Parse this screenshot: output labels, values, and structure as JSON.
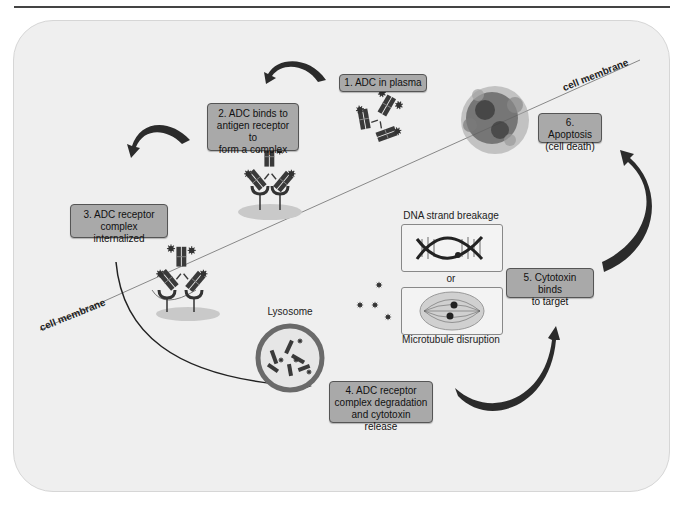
{
  "figure": {
    "steps": [
      {
        "number": 1,
        "label": "1. ADC in plasma"
      },
      {
        "number": 2,
        "label": "2. ADC binds to antigen receptor to form a complex"
      },
      {
        "number": 3,
        "label": "3. ADC receptor complex internalized"
      },
      {
        "number": 4,
        "label": "4. ADC receptor complex degradation and cytotoxin release"
      },
      {
        "number": 5,
        "label": "5. Cytotoxin binds to target"
      },
      {
        "number": 6,
        "label": "6. Apoptosis (cell death)"
      }
    ],
    "step_lines": {
      "s1": [
        "1. ADC in plasma"
      ],
      "s2": [
        "2. ADC binds to",
        "antigen receptor to",
        "form a complex"
      ],
      "s3": [
        "3. ADC receptor",
        "complex internalized"
      ],
      "s4": [
        "4. ADC receptor",
        "complex degradation",
        "and cytotoxin release"
      ],
      "s5": [
        "5. Cytotoxin binds",
        "to target"
      ],
      "s6": [
        "6. Apoptosis",
        "(cell death)"
      ]
    },
    "labels": {
      "membrane_left": "cell membrane",
      "membrane_right": "cell membrane",
      "lysosome": "Lysosome",
      "dna": "DNA strand breakage",
      "or": "or",
      "microtubule": "Microtubule disruption"
    },
    "colors": {
      "panel": "#efefef",
      "box_fill": "#a9a9a9",
      "antibody": "#3a3a3a",
      "arrow": "#2b2b2b",
      "surface": "#c9c9c9"
    }
  }
}
